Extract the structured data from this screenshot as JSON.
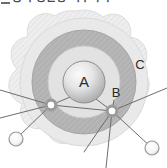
{
  "caption": {
    "text": "중 수능완성 지구과학",
    "dash_marker": "em-dash"
  },
  "diagram": {
    "labels": [
      {
        "id": "A",
        "text": "A",
        "x": 84,
        "y": 87,
        "font_size": 15,
        "description": "central sphere"
      },
      {
        "id": "B",
        "text": "B",
        "x": 116,
        "y": 97,
        "font_size": 13,
        "description": "inner node on middle shell"
      },
      {
        "id": "C",
        "text": "C",
        "x": 140,
        "y": 69,
        "font_size": 13,
        "description": "outer scalloped region"
      }
    ],
    "central_sphere": {
      "name": "A",
      "cx": 84,
      "cy": 82,
      "r": 21,
      "fill_light": "#f2f2f2",
      "fill_dark": "#a8a8a8",
      "stroke": "#8f8f8f"
    },
    "shells": [
      {
        "name": "inner-shell-light",
        "r": 36,
        "fill": "#e3e3e3",
        "stroke": "#cfcfcf"
      },
      {
        "name": "middle-shell-dark",
        "r": 52,
        "fill": "#b6b6b6",
        "stroke": "#a5a5a5"
      },
      {
        "name": "outer-shell-light",
        "r": 66,
        "fill": "#e8e8e8",
        "stroke": "#d4d4d4"
      }
    ],
    "outer_boundary": {
      "name": "C",
      "shape": "scalloped",
      "lobes": 13,
      "outer_r": 72,
      "inner_r": 64,
      "fill": "#eeeeee",
      "stroke": "#d8d8d8"
    },
    "nodes": [
      {
        "name": "node-left-junction",
        "cx": 51,
        "cy": 105,
        "r": 6,
        "fill": "#ffffff",
        "ring": "#8a8a8a",
        "halo": "#9a9a9a"
      },
      {
        "name": "node-right-junction-B",
        "cx": 112,
        "cy": 111,
        "r": 6,
        "fill": "#ffffff",
        "ring": "#8a8a8a",
        "halo": "#9a9a9a"
      },
      {
        "name": "node-bottom-left-open",
        "cx": 16,
        "cy": 139,
        "r": 7,
        "fill": "#ededed",
        "ring": "#9a9a9a",
        "halo": "none"
      },
      {
        "name": "node-bottom-right-open",
        "cx": 152,
        "cy": 148,
        "r": 7,
        "fill": "#ededed",
        "ring": "#9a9a9a",
        "halo": "none"
      }
    ],
    "connectors": [
      {
        "name": "connector-left-to-center",
        "x1": 51,
        "y1": 105,
        "x2": 78,
        "y2": 92
      },
      {
        "name": "connector-left-to-upper-left-edge",
        "x1": 51,
        "y1": 105,
        "x2": 0,
        "y2": 90
      },
      {
        "name": "connector-left-to-lower-left-edge",
        "x1": 51,
        "y1": 105,
        "x2": 0,
        "y2": 118
      },
      {
        "name": "connector-left-to-bottom-left-node",
        "x1": 51,
        "y1": 105,
        "x2": 16,
        "y2": 139
      },
      {
        "name": "connector-right-to-center",
        "x1": 112,
        "y1": 111,
        "x2": 92,
        "y2": 96
      },
      {
        "name": "connector-right-to-B-label",
        "x1": 112,
        "y1": 111,
        "x2": 114,
        "y2": 99
      },
      {
        "name": "connector-right-to-upper-right-edge",
        "x1": 112,
        "y1": 111,
        "x2": 167,
        "y2": 88
      },
      {
        "name": "connector-right-to-bottom-right-node",
        "x1": 112,
        "y1": 111,
        "x2": 152,
        "y2": 148
      },
      {
        "name": "connector-right-to-bottom-edge",
        "x1": 112,
        "y1": 111,
        "x2": 105,
        "y2": 168
      },
      {
        "name": "connector-right-to-lower-left",
        "x1": 112,
        "y1": 111,
        "x2": 86,
        "y2": 150
      }
    ],
    "stroke_color": "#6e6e6e",
    "stroke_width": 1
  }
}
